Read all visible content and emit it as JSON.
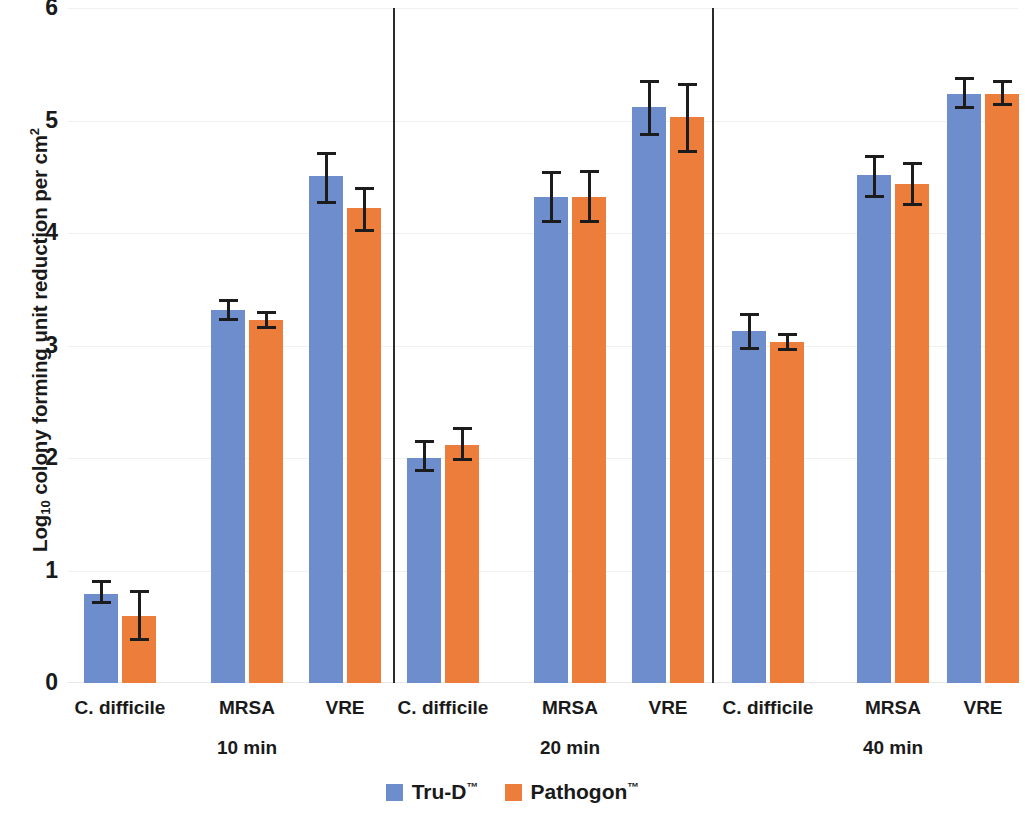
{
  "chart_data": {
    "type": "bar",
    "title": "",
    "subtitle": "",
    "xlabel": "",
    "ylabel": "Log10 colony forming unit reduction per cm2",
    "ylabel_parts": {
      "prefix": "Log",
      "sub": "10",
      "middle": " colony forming unit reduction per cm",
      "sup": "2"
    },
    "ylim": [
      0,
      6
    ],
    "ytick_labels": [
      "0",
      "1",
      "2",
      "3",
      "4",
      "5",
      "6"
    ],
    "ytick_values": [
      0,
      1,
      2,
      3,
      4,
      5,
      6
    ],
    "grid": "horizontal",
    "legend_position": "bottom-center",
    "group_labels": [
      "10 min",
      "20 min",
      "40 min"
    ],
    "categories": [
      "C. difficile",
      "MRSA",
      "VRE",
      "C. difficile",
      "MRSA",
      "VRE",
      "C. difficile",
      "MRSA",
      "VRE"
    ],
    "series": [
      {
        "name": "Tru-D",
        "name_tm": "™",
        "color": "#6d8dcd",
        "values": [
          0.79,
          3.32,
          4.51,
          2.0,
          4.32,
          5.12,
          3.13,
          4.52,
          5.24
        ],
        "err_low": [
          0.7,
          3.22,
          4.26,
          1.88,
          4.09,
          4.86,
          2.96,
          4.31,
          5.1
        ],
        "err_high": [
          0.92,
          3.41,
          4.72,
          2.16,
          4.55,
          5.36,
          3.29,
          4.69,
          5.39
        ]
      },
      {
        "name": "Pathogon",
        "name_tm": "™",
        "color": "#ed7d3a",
        "values": [
          0.6,
          3.23,
          4.22,
          2.12,
          4.32,
          5.03,
          3.03,
          4.44,
          5.24
        ],
        "err_low": [
          0.37,
          3.15,
          4.01,
          1.97,
          4.09,
          4.71,
          2.95,
          4.24,
          5.13
        ],
        "err_high": [
          0.83,
          3.31,
          4.41,
          2.28,
          4.56,
          5.33,
          3.11,
          4.63,
          5.36
        ]
      }
    ],
    "separators_after_category_index": [
      2,
      5
    ]
  },
  "legend": {
    "items": [
      {
        "label": "Tru-D",
        "tm": "™",
        "color": "#6d8dcd"
      },
      {
        "label": "Pathogon",
        "tm": "™",
        "color": "#ed7d3a"
      }
    ]
  }
}
